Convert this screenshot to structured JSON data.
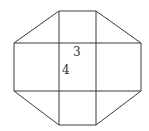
{
  "diagram": {
    "shape": "octagon divided into 3x3 grid",
    "labels": {
      "label_a": "3",
      "label_b": "4"
    },
    "colors": {
      "stroke": "#3a3a3a",
      "text": "#333333",
      "background": "#ffffff"
    }
  }
}
